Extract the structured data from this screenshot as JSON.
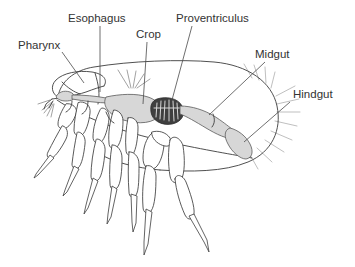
{
  "figure": {
    "background_color": "#ffffff",
    "line_color": "#3c3c3c",
    "label_color": "#333333"
  },
  "labels": [
    {
      "id": "pharynx",
      "text": "Pharynx",
      "text_x": 18,
      "text_y": 49,
      "leader": "M 62 52 L 84 83"
    },
    {
      "id": "esophagus",
      "text": "Esophagus",
      "text_x": 68,
      "text_y": 22,
      "leader": "M 100 26 L 100 92"
    },
    {
      "id": "crop",
      "text": "Crop",
      "text_x": 136,
      "text_y": 38,
      "leader": "M 147 42 L 143 104"
    },
    {
      "id": "proventriculus",
      "text": "Proventriculus",
      "text_x": 176,
      "text_y": 22,
      "leader": "M 192 26 L 172 100"
    },
    {
      "id": "midgut",
      "text": "Midgut",
      "text_x": 255,
      "text_y": 58,
      "leader": "M 265 62 L 209 115"
    },
    {
      "id": "hindgut",
      "text": "Hindgut",
      "text_x": 293,
      "text_y": 98,
      "leader": "M 290 102 L 244 142"
    }
  ],
  "organs": [
    {
      "id": "pharynx-organ",
      "name": "pharynx",
      "fill": "#d7d7d7"
    },
    {
      "id": "crop-organ",
      "name": "crop",
      "fill": "#d7d7d7"
    },
    {
      "id": "proventriculus-organ",
      "name": "proventriculus",
      "fill": "#3f3f3f"
    },
    {
      "id": "midgut-organ",
      "name": "midgut",
      "fill": "#d7d7d7"
    },
    {
      "id": "hindgut-organ",
      "name": "hindgut",
      "fill": "#d7d7d7"
    }
  ],
  "colors": {
    "organ_light": "#d7d7d7",
    "organ_dark": "#3f3f3f",
    "outline": "#3c3c3c",
    "seta": "#b8b8b8",
    "label": "#333333"
  }
}
